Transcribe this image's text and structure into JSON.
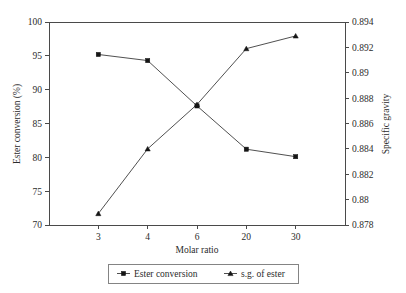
{
  "chart_data": {
    "type": "line",
    "title": "",
    "xlabel": "Molar ratio",
    "categories": [
      "3",
      "4",
      "6",
      "20",
      "30"
    ],
    "grid": false,
    "legend_position": "bottom-center",
    "axes": {
      "left": {
        "label": "Ester conversion (%)",
        "ticks": [
          "70",
          "75",
          "80",
          "85",
          "90",
          "95",
          "100"
        ],
        "tick_values": [
          70,
          75,
          80,
          85,
          90,
          95,
          100
        ],
        "ylim": [
          70,
          100
        ]
      },
      "right": {
        "label": "Specific gravity",
        "ticks": [
          "0.878",
          "0.88",
          "0.882",
          "0.884",
          "0.886",
          "0.888",
          "0.89",
          "0.892",
          "0.894"
        ],
        "tick_values": [
          0.878,
          0.88,
          0.882,
          0.884,
          0.886,
          0.888,
          0.89,
          0.892,
          0.894
        ],
        "ylim": [
          0.878,
          0.894
        ]
      }
    },
    "series": [
      {
        "name": "Ester conversion",
        "axis": "left",
        "marker": "filled-square",
        "values": [
          95.2,
          94.3,
          87.6,
          81.2,
          80.1
        ]
      },
      {
        "name": "s.g. of ester",
        "axis": "right",
        "marker": "filled-triangle",
        "values": [
          0.8789,
          0.884,
          0.8875,
          0.8919,
          0.8929
        ]
      }
    ],
    "legend": [
      {
        "label": "Ester conversion",
        "marker": "filled-square"
      },
      {
        "label": "s.g. of ester",
        "marker": "filled-triangle"
      }
    ]
  }
}
